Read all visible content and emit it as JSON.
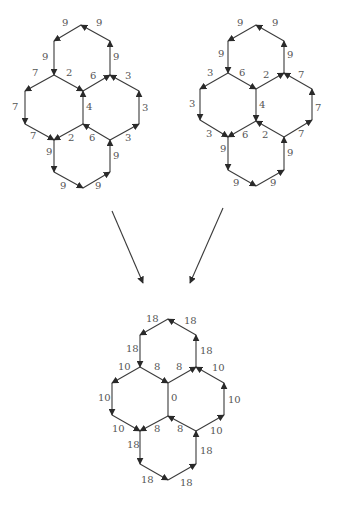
{
  "colors": {
    "line": "#3a3a3a",
    "label": "#555555",
    "background": "#ffffff"
  },
  "figures": [
    {
      "id": "left-flow",
      "vertices": {
        "T": [
          81,
          25
        ],
        "UL": [
          54,
          41
        ],
        "UR": [
          110,
          41
        ],
        "JL": [
          54,
          75
        ],
        "JR": [
          110,
          75
        ],
        "C1": [
          83,
          91
        ],
        "L": [
          25,
          91
        ],
        "R": [
          139,
          91
        ],
        "LB": [
          25,
          124
        ],
        "C2": [
          83,
          124
        ],
        "JLL": [
          54,
          140
        ],
        "JLR": [
          110,
          140
        ],
        "RB": [
          139,
          124
        ],
        "BL": [
          54,
          172
        ],
        "B": [
          83,
          188
        ],
        "BR": [
          110,
          172
        ]
      },
      "edges": [
        {
          "from": "T",
          "to": "UL",
          "label": "9",
          "lx": 62,
          "ly": 26
        },
        {
          "from": "UR",
          "to": "T",
          "label": "9",
          "lx": 96,
          "ly": 26
        },
        {
          "from": "UL",
          "to": "JL",
          "label": "9",
          "lx": 42,
          "ly": 60
        },
        {
          "from": "JR",
          "to": "UR",
          "label": "9",
          "lx": 113,
          "ly": 60
        },
        {
          "from": "JL",
          "to": "L",
          "label": "7",
          "lx": 32,
          "ly": 76
        },
        {
          "from": "JL",
          "to": "C1",
          "label": "2",
          "lx": 66,
          "ly": 76
        },
        {
          "from": "C1",
          "to": "JR",
          "label": "6",
          "lx": 90,
          "ly": 79
        },
        {
          "from": "R",
          "to": "JR",
          "label": "3",
          "lx": 125,
          "ly": 79
        },
        {
          "from": "L",
          "to": "LB",
          "label": "7",
          "lx": 12,
          "ly": 110
        },
        {
          "from": "C2",
          "to": "C1",
          "label": "4",
          "lx": 86,
          "ly": 110
        },
        {
          "from": "LB",
          "to": "JLL",
          "label": "7",
          "lx": 30,
          "ly": 139
        },
        {
          "from": "C2",
          "to": "JLL",
          "label": "2",
          "lx": 68,
          "ly": 141
        },
        {
          "from": "JLR",
          "to": "C2",
          "label": "6",
          "lx": 89,
          "ly": 141
        },
        {
          "from": "JLR",
          "to": "RB",
          "label": "3",
          "lx": 125,
          "ly": 141
        },
        {
          "from": "RB",
          "to": "R",
          "label": "3",
          "lx": 142,
          "ly": 111
        },
        {
          "from": "JLL",
          "to": "BL",
          "label": "9",
          "lx": 46,
          "ly": 155
        },
        {
          "from": "BR",
          "to": "JLR",
          "label": "9",
          "lx": 113,
          "ly": 159
        },
        {
          "from": "BL",
          "to": "B",
          "label": "9",
          "lx": 60,
          "ly": 189
        },
        {
          "from": "B",
          "to": "BR",
          "label": "9",
          "lx": 95,
          "ly": 189
        }
      ]
    },
    {
      "id": "right-flow",
      "vertices": {
        "T": [
          256,
          25
        ],
        "UL": [
          228,
          41
        ],
        "UR": [
          284,
          41
        ],
        "JL": [
          228,
          73
        ],
        "JR": [
          284,
          73
        ],
        "C1": [
          256,
          89
        ],
        "L": [
          200,
          89
        ],
        "R": [
          312,
          89
        ],
        "LB": [
          200,
          120
        ],
        "C2": [
          256,
          121
        ],
        "JLL": [
          228,
          137
        ],
        "JLR": [
          284,
          137
        ],
        "RB": [
          312,
          120
        ],
        "BL": [
          228,
          170
        ],
        "B": [
          256,
          186
        ],
        "BR": [
          284,
          170
        ]
      },
      "edges": [
        {
          "from": "T",
          "to": "UL",
          "label": "9",
          "lx": 237,
          "ly": 26
        },
        {
          "from": "UR",
          "to": "T",
          "label": "9",
          "lx": 272,
          "ly": 26
        },
        {
          "from": "UL",
          "to": "JL",
          "label": "9",
          "lx": 218,
          "ly": 57
        },
        {
          "from": "JR",
          "to": "UR",
          "label": "9",
          "lx": 287,
          "ly": 58
        },
        {
          "from": "JL",
          "to": "L",
          "label": "3",
          "lx": 207,
          "ly": 76
        },
        {
          "from": "JL",
          "to": "C1",
          "label": "6",
          "lx": 239,
          "ly": 76
        },
        {
          "from": "C1",
          "to": "JR",
          "label": "2",
          "lx": 263,
          "ly": 78
        },
        {
          "from": "R",
          "to": "JR",
          "label": "7",
          "lx": 298,
          "ly": 78
        },
        {
          "from": "L",
          "to": "LB",
          "label": "3",
          "lx": 189,
          "ly": 107
        },
        {
          "from": "C1",
          "to": "C2",
          "label": "4",
          "lx": 259,
          "ly": 108
        },
        {
          "from": "LB",
          "to": "JLL",
          "label": "3",
          "lx": 206,
          "ly": 137
        },
        {
          "from": "C2",
          "to": "JLL",
          "label": "6",
          "lx": 242,
          "ly": 138
        },
        {
          "from": "JLR",
          "to": "C2",
          "label": "2",
          "lx": 262,
          "ly": 138
        },
        {
          "from": "JLR",
          "to": "RB",
          "label": "7",
          "lx": 298,
          "ly": 137
        },
        {
          "from": "RB",
          "to": "R",
          "label": "7",
          "lx": 315,
          "ly": 111
        },
        {
          "from": "JLL",
          "to": "BL",
          "label": "9",
          "lx": 220,
          "ly": 152
        },
        {
          "from": "BR",
          "to": "JLR",
          "label": "9",
          "lx": 287,
          "ly": 156
        },
        {
          "from": "BL",
          "to": "B",
          "label": "9",
          "lx": 233,
          "ly": 186
        },
        {
          "from": "B",
          "to": "BR",
          "label": "9",
          "lx": 270,
          "ly": 186
        }
      ]
    },
    {
      "id": "sum-flow",
      "vertices": {
        "T": [
          168,
          319
        ],
        "UL": [
          140,
          335
        ],
        "UR": [
          196,
          335
        ],
        "JL": [
          140,
          367
        ],
        "JR": [
          196,
          367
        ],
        "C1": [
          168,
          383
        ],
        "L": [
          112,
          383
        ],
        "R": [
          224,
          383
        ],
        "LB": [
          112,
          415
        ],
        "C2": [
          168,
          416
        ],
        "JLL": [
          140,
          431
        ],
        "JLR": [
          196,
          431
        ],
        "RB": [
          224,
          415
        ],
        "BL": [
          140,
          464
        ],
        "B": [
          168,
          480
        ],
        "BR": [
          196,
          464
        ]
      },
      "edges": [
        {
          "from": "T",
          "to": "UL",
          "label": "18",
          "lx": 146,
          "ly": 322
        },
        {
          "from": "UR",
          "to": "T",
          "label": "18",
          "lx": 184,
          "ly": 324
        },
        {
          "from": "UL",
          "to": "JL",
          "label": "18",
          "lx": 126,
          "ly": 352
        },
        {
          "from": "JR",
          "to": "UR",
          "label": "18",
          "lx": 200,
          "ly": 354
        },
        {
          "from": "JL",
          "to": "L",
          "label": "10",
          "lx": 118,
          "ly": 370
        },
        {
          "from": "JL",
          "to": "C1",
          "label": "8",
          "lx": 154,
          "ly": 370
        },
        {
          "from": "C1",
          "to": "JR",
          "label": "8",
          "lx": 176,
          "ly": 370
        },
        {
          "from": "R",
          "to": "JR",
          "label": "10",
          "lx": 212,
          "ly": 371
        },
        {
          "from": "L",
          "to": "LB",
          "label": "10",
          "lx": 98,
          "ly": 401
        },
        {
          "from": "C1",
          "to": "C2",
          "label": "0",
          "lx": 171,
          "ly": 401,
          "no_arrow": true
        },
        {
          "from": "LB",
          "to": "JLL",
          "label": "10",
          "lx": 112,
          "ly": 432
        },
        {
          "from": "C2",
          "to": "JLL",
          "label": "8",
          "lx": 154,
          "ly": 432
        },
        {
          "from": "JLR",
          "to": "C2",
          "label": "8",
          "lx": 177,
          "ly": 432
        },
        {
          "from": "JLR",
          "to": "RB",
          "label": "10",
          "lx": 210,
          "ly": 434
        },
        {
          "from": "RB",
          "to": "R",
          "label": "10",
          "lx": 228,
          "ly": 403
        },
        {
          "from": "JLL",
          "to": "BL",
          "label": "18",
          "lx": 127,
          "ly": 448
        },
        {
          "from": "BR",
          "to": "JLR",
          "label": "18",
          "lx": 200,
          "ly": 454
        },
        {
          "from": "BL",
          "to": "B",
          "label": "18",
          "lx": 141,
          "ly": 483
        },
        {
          "from": "B",
          "to": "BR",
          "label": "18",
          "lx": 180,
          "ly": 486
        }
      ]
    }
  ],
  "connectors": [
    {
      "id": "left-to-sum",
      "x1": 112,
      "y1": 211,
      "x2": 143,
      "y2": 283
    },
    {
      "id": "right-to-sum",
      "x1": 223,
      "y1": 208,
      "x2": 190,
      "y2": 283
    }
  ]
}
